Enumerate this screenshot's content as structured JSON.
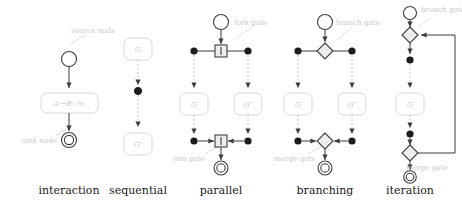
{
  "figure": {
    "title": "",
    "panels": [
      {
        "id": "interaction",
        "caption": "interaction",
        "annotations": [
          "source node",
          "sink node"
        ],
        "nodes": [
          {
            "name": "source node",
            "shape": "circle-open"
          },
          {
            "name": "interaction box",
            "shape": "rounded-rect",
            "label": "A→B: m"
          },
          {
            "name": "sink node",
            "shape": "circle-double"
          }
        ],
        "edges": [
          "source-to-box",
          "box-to-sink"
        ]
      },
      {
        "id": "sequential",
        "caption": "sequential",
        "annotations": [],
        "nodes": [
          {
            "name": "graph box top",
            "shape": "rounded-rect",
            "label": "G"
          },
          {
            "name": "sequence dot",
            "shape": "circle-filled"
          },
          {
            "name": "graph box bottom",
            "shape": "rounded-rect",
            "label": "G'"
          }
        ],
        "edges": [
          "G-to-dot",
          "dot-to-Gprime"
        ]
      },
      {
        "id": "parallel",
        "caption": "parallel",
        "annotations": [
          "fork gate",
          "join gate"
        ],
        "nodes": [
          {
            "name": "source node",
            "shape": "circle-open"
          },
          {
            "name": "fork gate",
            "shape": "square-bar"
          },
          {
            "name": "graph box left",
            "shape": "rounded-rect",
            "label": "G"
          },
          {
            "name": "graph box right",
            "shape": "rounded-rect",
            "label": "G'"
          },
          {
            "name": "join gate",
            "shape": "square-bar"
          },
          {
            "name": "sink node",
            "shape": "circle-double"
          }
        ],
        "edges": [
          "source-to-fork",
          "fork-branches",
          "branches-to-join",
          "join-to-sink"
        ]
      },
      {
        "id": "branching",
        "caption": "branching",
        "annotations": [
          "branch gate",
          "merge gate"
        ],
        "nodes": [
          {
            "name": "source node",
            "shape": "circle-open"
          },
          {
            "name": "branch gate",
            "shape": "diamond"
          },
          {
            "name": "graph box left",
            "shape": "rounded-rect",
            "label": "G"
          },
          {
            "name": "graph box right",
            "shape": "rounded-rect",
            "label": "G'"
          },
          {
            "name": "merge gate",
            "shape": "diamond"
          },
          {
            "name": "sink node",
            "shape": "circle-double"
          }
        ],
        "edges": [
          "source-to-branch",
          "branch-alternatives",
          "alternatives-to-merge",
          "merge-to-sink"
        ]
      },
      {
        "id": "iteration",
        "caption": "iteration",
        "annotations": [
          "branch gate",
          "merge gate"
        ],
        "nodes": [
          {
            "name": "source node",
            "shape": "circle-open"
          },
          {
            "name": "branch gate",
            "shape": "diamond"
          },
          {
            "name": "loop dot top",
            "shape": "circle-filled"
          },
          {
            "name": "graph box",
            "shape": "rounded-rect",
            "label": "G"
          },
          {
            "name": "loop dot bottom",
            "shape": "circle-filled"
          },
          {
            "name": "merge gate",
            "shape": "diamond"
          },
          {
            "name": "sink node",
            "shape": "circle-double"
          }
        ],
        "edges": [
          "source-to-branch",
          "branch-to-G",
          "G-to-merge",
          "merge-to-sink",
          "loop-back-edge"
        ]
      }
    ],
    "labels": {
      "source_node": "source node",
      "sink_node": "sink node",
      "fork_gate": "fork gate",
      "join_gate": "join gate",
      "branch_gate": "branch gate",
      "merge_gate": "merge gate",
      "graph_g": "G",
      "graph_g_prime": "G'",
      "interaction_message": "A→B: m"
    },
    "captions": {
      "interaction": "interaction",
      "sequential": "sequential",
      "parallel": "parallel",
      "branching": "branching",
      "iteration": "iteration"
    },
    "colors": {
      "stroke": "#4a4a4a",
      "light_stroke": "#d6d6d6",
      "annotation_text": "#c9c9c9",
      "box_text": "#cfcfcf",
      "caption_text": "#1a1a1a",
      "fill_node": "#ffffff",
      "gate_fill": "#ededed",
      "background": "#ffffff"
    }
  }
}
